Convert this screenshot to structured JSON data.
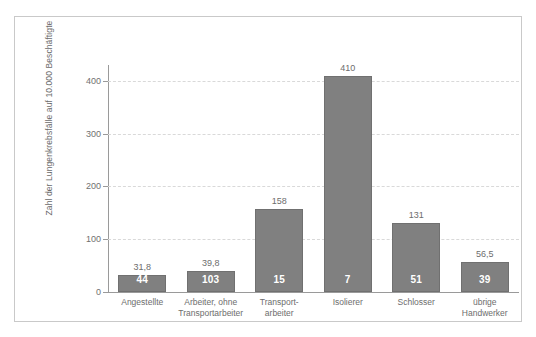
{
  "chart_data": {
    "type": "bar",
    "title": "",
    "xlabel": "",
    "ylabel": "Zahl der Lungenkrebsfälle auf 10.000 Beschäftigte",
    "ylim": [
      0,
      430
    ],
    "yticks": [
      "0",
      "100",
      "200",
      "300",
      "400"
    ],
    "ytick_values": [
      0,
      100,
      200,
      300,
      400
    ],
    "grid": "horizontal-dashed",
    "legend": "none",
    "bar_color": "#808080",
    "categories": [
      "Angestellte",
      "Arbeiter, ohne Transportarbeiter",
      "Transport- arbeiter",
      "Isolierer",
      "Schlosser",
      "übrige Handwerker"
    ],
    "category_lines": [
      [
        "Angestellte"
      ],
      [
        "Arbeiter, ohne",
        "Transportarbeiter"
      ],
      [
        "Transport-",
        "arbeiter"
      ],
      [
        "Isolierer"
      ],
      [
        "Schlosser"
      ],
      [
        "übrige",
        "Handwerker"
      ]
    ],
    "values": [
      31.8,
      39.8,
      158,
      410,
      131,
      56.5
    ],
    "value_labels": [
      "31,8",
      "39,8",
      "158",
      "410",
      "131",
      "56,5"
    ],
    "counts": [
      "44",
      "103",
      "15",
      "7",
      "51",
      "39"
    ]
  }
}
